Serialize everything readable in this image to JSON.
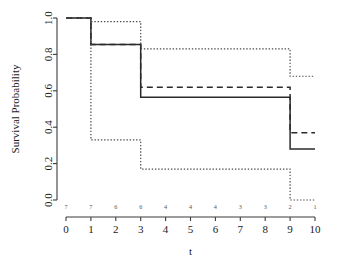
{
  "chart_data": {
    "type": "line",
    "title": "",
    "xlabel": "t",
    "ylabel": "Survival Probability",
    "xlim": [
      0,
      10
    ],
    "ylim": [
      0.0,
      1.0
    ],
    "grid": false,
    "legend": "none",
    "x_ticks": [
      "0",
      "1",
      "2",
      "3",
      "4",
      "5",
      "6",
      "7",
      "8",
      "9",
      "10"
    ],
    "x_tick_values": [
      0,
      1,
      2,
      3,
      4,
      5,
      6,
      7,
      8,
      9,
      10
    ],
    "y_ticks": [
      "0.0",
      "0.2",
      "0.4",
      "0.6",
      "0.8",
      "1.0"
    ],
    "y_tick_values": [
      0.0,
      0.2,
      0.4,
      0.6,
      0.8,
      1.0
    ],
    "step_style": "post",
    "series": [
      {
        "name": "survival-estimate",
        "style": "solid",
        "x": [
          0,
          1,
          3,
          9,
          10
        ],
        "values": [
          1.0,
          0.855,
          0.565,
          0.28,
          0.28
        ]
      },
      {
        "name": "comparison-estimate",
        "style": "dashed",
        "x": [
          0,
          1,
          3,
          9,
          10
        ],
        "values": [
          1.0,
          0.855,
          0.62,
          0.37,
          0.37
        ]
      },
      {
        "name": "upper-confidence-bound",
        "style": "dotted",
        "x": [
          0,
          1,
          3,
          9,
          10
        ],
        "values": [
          1.0,
          0.98,
          0.83,
          0.68,
          0.68
        ]
      },
      {
        "name": "lower-confidence-bound",
        "style": "dotted",
        "x": [
          0,
          1,
          3,
          9,
          10
        ],
        "values": [
          1.0,
          0.33,
          0.17,
          0.0,
          0.0
        ]
      }
    ],
    "numbers_at_risk": {
      "label": "",
      "x": [
        0,
        1,
        2,
        3,
        4,
        5,
        6,
        7,
        8,
        9,
        10
      ],
      "values": [
        "7",
        "7",
        "6",
        "6",
        "4",
        "4",
        "4",
        "3",
        "3",
        "2",
        "1"
      ]
    }
  },
  "colors": {
    "axis": "#3b3b3b",
    "solid_curve": "#2b2b2b",
    "dashed_curve": "#2b2b2b",
    "dotted_curve": "#4a4a4a",
    "background": "#ffffff",
    "risk_text": "#555555"
  }
}
